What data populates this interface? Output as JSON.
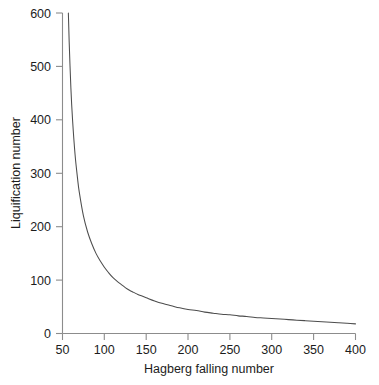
{
  "chart_data": {
    "type": "line",
    "title": "",
    "xlabel": "Hagberg falling number",
    "ylabel": "Liquification number",
    "xlim": [
      50,
      400
    ],
    "ylim": [
      0,
      600
    ],
    "xticks": [
      50,
      100,
      150,
      200,
      250,
      300,
      350,
      400
    ],
    "yticks": [
      0,
      100,
      200,
      300,
      400,
      500,
      600
    ],
    "grid": false,
    "legend": null,
    "series": [
      {
        "name": "Liquification number",
        "x": [
          57,
          58,
          60,
          62,
          65,
          68,
          70,
          75,
          80,
          85,
          90,
          95,
          100,
          105,
          110,
          115,
          120,
          125,
          130,
          135,
          140,
          145,
          150,
          160,
          170,
          180,
          190,
          200,
          210,
          220,
          230,
          240,
          250,
          260,
          270,
          280,
          290,
          300,
          310,
          320,
          330,
          340,
          350,
          360,
          370,
          380,
          390,
          400
        ],
        "values": [
          600,
          545,
          460,
          400,
          335,
          290,
          265,
          220,
          190,
          168,
          150,
          136,
          124,
          114,
          105,
          98,
          92,
          86,
          81,
          77,
          73,
          70,
          67,
          61,
          56,
          52,
          48,
          45,
          43,
          40,
          38,
          36,
          35,
          33,
          32,
          30,
          29,
          28,
          27,
          26,
          25,
          24,
          23,
          22,
          21,
          20,
          19,
          18
        ]
      }
    ],
    "curve_note": "monotonic hyperbolic decay"
  },
  "axes": {
    "y_tick_labels": [
      "600",
      "500",
      "400",
      "300",
      "200",
      "100",
      "0"
    ],
    "x_tick_labels": [
      "50",
      "100",
      "150",
      "200",
      "250",
      "300",
      "350",
      "400"
    ],
    "y_axis_title": "Liquification number",
    "x_axis_title": "Hagberg falling number"
  },
  "colors": {
    "curve": "#4d4d4d",
    "axis": "#8c8c8c",
    "text": "#1c1c1c",
    "background": "#ffffff"
  }
}
